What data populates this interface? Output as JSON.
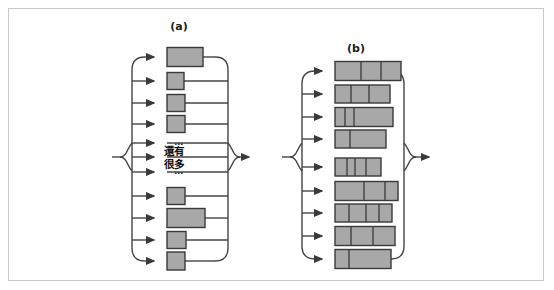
{
  "figure": {
    "background": "#ffffff",
    "frame_border_color": "#c9c9c9",
    "line_color": "#444444",
    "box_fill": "#a8a8a8",
    "box_stroke": "#3a3a3a"
  },
  "panels": [
    {
      "id": "a",
      "label": "(a)",
      "label_x": 179,
      "label_y": 30,
      "spine_left_x": 132,
      "spine_right_x": 228,
      "box_left_x": 167,
      "arrow_in_x": 152,
      "input_arrow_x": 112,
      "output_arrow_x": 252,
      "center_y": 157,
      "rows": [
        {
          "index": 0,
          "y": 57,
          "box_width": 36,
          "box_height": 19,
          "line_to_x": 228,
          "kind": "box"
        },
        {
          "index": 1,
          "y": 81,
          "box_width": 17,
          "box_height": 17,
          "line_to_x": 228,
          "kind": "box"
        },
        {
          "index": 2,
          "y": 103,
          "box_width": 18,
          "box_height": 17,
          "line_to_x": 228,
          "kind": "box"
        },
        {
          "index": 3,
          "y": 124,
          "box_width": 18,
          "box_height": 17,
          "line_to_x": 228,
          "kind": "box"
        },
        {
          "index": 4,
          "y": 143,
          "box_width": 0,
          "box_height": 0,
          "line_to_x": 228,
          "kind": "dots",
          "dots": "…"
        },
        {
          "index": 5,
          "y": 157,
          "box_width": 0,
          "box_height": 0,
          "line_to_x": 228,
          "kind": "cjk"
        },
        {
          "index": 6,
          "y": 172,
          "box_width": 0,
          "box_height": 0,
          "line_to_x": 228,
          "kind": "dots",
          "dots": "…"
        },
        {
          "index": 7,
          "y": 196,
          "box_width": 18,
          "box_height": 17,
          "line_to_x": 228,
          "kind": "box"
        },
        {
          "index": 8,
          "y": 218,
          "box_width": 38,
          "box_height": 19,
          "line_to_x": 228,
          "kind": "box"
        },
        {
          "index": 9,
          "y": 240,
          "box_width": 19,
          "box_height": 17,
          "line_to_x": 228,
          "kind": "box"
        },
        {
          "index": 10,
          "y": 261,
          "box_width": 18,
          "box_height": 18,
          "line_to_x": 228,
          "kind": "box"
        }
      ],
      "annotation_lines": [
        "還有",
        "很多"
      ],
      "annotation_x": 164,
      "annotation_y1": 155,
      "annotation_y2": 168
    },
    {
      "id": "b",
      "label": "(b)",
      "label_x": 356,
      "label_y": 52,
      "spine_left_x": 302,
      "spine_right_x": 404,
      "box_left_x": 335,
      "arrow_in_x": 320,
      "input_arrow_x": 282,
      "output_arrow_x": 432,
      "center_y": 157,
      "rows": [
        {
          "index": 0,
          "y": 71,
          "box_width": 66,
          "box_height": 19,
          "segments": [
            26,
            20,
            20
          ]
        },
        {
          "index": 1,
          "y": 94,
          "box_width": 55,
          "box_height": 18,
          "segments": [
            16,
            18,
            21
          ]
        },
        {
          "index": 2,
          "y": 117,
          "box_width": 58,
          "box_height": 19,
          "segments": [
            10,
            9,
            39
          ]
        },
        {
          "index": 3,
          "y": 139,
          "box_width": 51,
          "box_height": 18,
          "segments": [
            15,
            36
          ]
        },
        {
          "index": 4,
          "y": 167,
          "box_width": 46,
          "box_height": 18,
          "segments": [
            12,
            8,
            11,
            15
          ]
        },
        {
          "index": 5,
          "y": 191,
          "box_width": 63,
          "box_height": 19,
          "segments": [
            29,
            21,
            13
          ]
        },
        {
          "index": 6,
          "y": 213,
          "box_width": 57,
          "box_height": 18,
          "segments": [
            14,
            17,
            13,
            13
          ]
        },
        {
          "index": 7,
          "y": 236,
          "box_width": 60,
          "box_height": 19,
          "segments": [
            16,
            22,
            22
          ]
        },
        {
          "index": 8,
          "y": 259,
          "box_width": 56,
          "box_height": 19,
          "segments": [
            14,
            42
          ]
        }
      ]
    }
  ]
}
